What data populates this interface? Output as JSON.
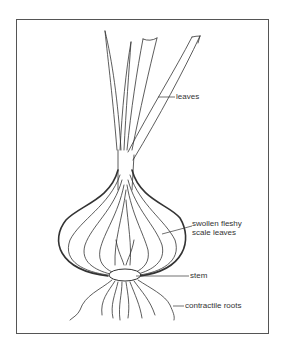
{
  "diagram": {
    "labels": {
      "leaves": "leaves",
      "scale_leaves_line1": "swollen fleshy",
      "scale_leaves_line2": "scale leaves",
      "stem": "stem",
      "roots": "contractile roots"
    },
    "colors": {
      "line": "#333333",
      "frame": "#555555",
      "background": "#ffffff"
    }
  }
}
